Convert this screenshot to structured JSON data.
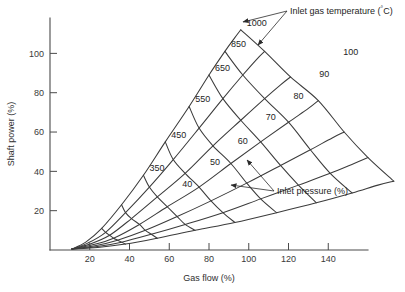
{
  "chart_data": {
    "type": "line",
    "title": "",
    "xlabel": "Gas flow (%)",
    "ylabel": "Shaft power (%)",
    "xlim": [
      0,
      160
    ],
    "ylim": [
      0,
      118
    ],
    "xticks": [
      20,
      40,
      60,
      80,
      100,
      120,
      140
    ],
    "yticks": [
      20,
      40,
      60,
      80,
      100
    ],
    "grid": false,
    "legend": "none",
    "annotations": [
      {
        "name": "inlet-gas-temperature-annotation",
        "text": "Inlet gas temperature (°C)",
        "text_x": 290,
        "text_y": 14,
        "targets": [
          [
            243,
            22
          ],
          [
            258,
            45
          ]
        ]
      },
      {
        "name": "inlet-pressure-annotation",
        "text": "Inlet pressure (%)",
        "text_x": 277,
        "text_y": 194,
        "targets": [
          [
            247,
            160
          ],
          [
            231,
            185
          ]
        ]
      }
    ],
    "series_groups": [
      {
        "group_name": "inlet-pressure",
        "group_label": "Inlet pressure (%)",
        "label_unit": "%",
        "series": [
          {
            "name": "100",
            "label": "100",
            "label_x": 144,
            "label_y": 100,
            "points": [
              [
                11,
                0.5
              ],
              [
                18,
                4
              ],
              [
                26,
                11
              ],
              [
                36,
                23
              ],
              [
                47,
                38
              ],
              [
                58,
                55
              ],
              [
                70,
                73
              ],
              [
                80,
                89
              ],
              [
                88,
                101
              ],
              [
                93,
                108
              ],
              [
                96,
                112
              ]
            ]
          },
          {
            "name": "90",
            "label": "90",
            "label_x": 132,
            "label_y": 89,
            "points": [
              [
                11,
                0.5
              ],
              [
                19,
                3.5
              ],
              [
                28,
                9
              ],
              [
                38,
                19
              ],
              [
                50,
                32
              ],
              [
                62,
                46
              ],
              [
                75,
                62
              ],
              [
                87,
                77
              ],
              [
                97,
                89
              ],
              [
                104,
                97
              ],
              [
                108,
                101
              ]
            ]
          },
          {
            "name": "80",
            "label": "80",
            "label_x": 119,
            "label_y": 78,
            "points": [
              [
                11,
                0.5
              ],
              [
                20,
                3
              ],
              [
                30,
                7.5
              ],
              [
                41,
                16
              ],
              [
                54,
                27
              ],
              [
                68,
                39
              ],
              [
                82,
                53
              ],
              [
                96,
                66
              ],
              [
                108,
                77
              ],
              [
                116,
                84
              ],
              [
                121,
                88
              ]
            ]
          },
          {
            "name": "70",
            "label": "70",
            "label_x": 105,
            "label_y": 67,
            "points": [
              [
                11,
                0.5
              ],
              [
                21,
                2.5
              ],
              [
                32,
                6
              ],
              [
                45,
                13
              ],
              [
                59,
                22
              ],
              [
                75,
                32
              ],
              [
                91,
                44
              ],
              [
                106,
                55
              ],
              [
                120,
                65
              ],
              [
                130,
                72
              ],
              [
                135,
                76
              ]
            ]
          },
          {
            "name": "60",
            "label": "60",
            "label_x": 91,
            "label_y": 55,
            "points": [
              [
                11,
                0.5
              ],
              [
                22,
                2
              ],
              [
                34,
                5
              ],
              [
                48,
                10
              ],
              [
                64,
                17
              ],
              [
                81,
                25
              ],
              [
                99,
                34
              ],
              [
                116,
                43
              ],
              [
                131,
                51
              ],
              [
                142,
                57
              ],
              [
                148,
                60
              ]
            ]
          },
          {
            "name": "50",
            "label": "50",
            "label_x": 77,
            "label_y": 44,
            "points": [
              [
                11,
                0.5
              ],
              [
                23,
                1.6
              ],
              [
                36,
                4
              ],
              [
                51,
                8
              ],
              [
                68,
                13
              ],
              [
                87,
                19
              ],
              [
                106,
                26
              ],
              [
                125,
                33
              ],
              [
                141,
                39
              ],
              [
                153,
                44
              ],
              [
                160,
                47
              ]
            ]
          },
          {
            "name": "40",
            "label": "40",
            "label_x": 63,
            "label_y": 33,
            "points": [
              [
                11,
                0.5
              ],
              [
                24,
                1.3
              ],
              [
                38,
                3
              ],
              [
                54,
                6
              ],
              [
                73,
                10
              ],
              [
                93,
                14
              ],
              [
                114,
                19
              ],
              [
                134,
                24
              ],
              [
                152,
                29
              ],
              [
                165,
                33
              ],
              [
                173,
                35
              ]
            ]
          }
        ]
      },
      {
        "group_name": "inlet-gas-temperature",
        "group_label": "Inlet gas temperature (°C)",
        "label_unit": "°C",
        "series": [
          {
            "name": "1000",
            "label": "1000",
            "label_x": 96,
            "label_y": 112,
            "points": [
              [
                96,
                112
              ],
              [
                108,
                101
              ],
              [
                121,
                88
              ],
              [
                135,
                76
              ],
              [
                148,
                60
              ],
              [
                160,
                47
              ],
              [
                173,
                35
              ]
            ]
          },
          {
            "name": "850",
            "label": "850",
            "label_x": 88,
            "label_y": 101,
            "points": [
              [
                88,
                101
              ],
              [
                97,
                89
              ],
              [
                108,
                77
              ],
              [
                120,
                65
              ],
              [
                131,
                51
              ],
              [
                141,
                39
              ],
              [
                152,
                29
              ]
            ]
          },
          {
            "name": "650",
            "label": "650",
            "label_x": 80,
            "label_y": 89,
            "points": [
              [
                80,
                89
              ],
              [
                87,
                77
              ],
              [
                96,
                66
              ],
              [
                106,
                55
              ],
              [
                116,
                43
              ],
              [
                125,
                33
              ],
              [
                134,
                24
              ]
            ]
          },
          {
            "name": "550",
            "label": "550",
            "label_x": 70,
            "label_y": 73,
            "points": [
              [
                70,
                73
              ],
              [
                75,
                62
              ],
              [
                82,
                53
              ],
              [
                91,
                44
              ],
              [
                99,
                34
              ],
              [
                106,
                26
              ],
              [
                114,
                19
              ]
            ]
          },
          {
            "name": "450",
            "label": "450",
            "label_x": 58,
            "label_y": 55,
            "points": [
              [
                58,
                55
              ],
              [
                62,
                46
              ],
              [
                68,
                39
              ],
              [
                75,
                32
              ],
              [
                81,
                25
              ],
              [
                87,
                19
              ],
              [
                93,
                14
              ]
            ]
          },
          {
            "name": "350",
            "label": "350",
            "label_x": 47,
            "label_y": 38,
            "points": [
              [
                47,
                38
              ],
              [
                50,
                32
              ],
              [
                54,
                27
              ],
              [
                59,
                22
              ],
              [
                64,
                17
              ],
              [
                68,
                13
              ],
              [
                73,
                10
              ]
            ]
          },
          {
            "name": "cross-250",
            "label": "",
            "label_x": 0,
            "label_y": 0,
            "points": [
              [
                36,
                23
              ],
              [
                38,
                19
              ],
              [
                41,
                16
              ],
              [
                45,
                13
              ],
              [
                48,
                10
              ],
              [
                51,
                8
              ],
              [
                54,
                6
              ]
            ]
          },
          {
            "name": "cross-150",
            "label": "",
            "label_x": 0,
            "label_y": 0,
            "points": [
              [
                26,
                11
              ],
              [
                28,
                9
              ],
              [
                30,
                7.5
              ],
              [
                32,
                6
              ],
              [
                34,
                5
              ],
              [
                36,
                4
              ],
              [
                38,
                3
              ]
            ]
          }
        ]
      }
    ],
    "curve_labels": {
      "pressure": [
        "100",
        "90",
        "80",
        "70",
        "60",
        "50",
        "40"
      ],
      "temperature": [
        "1000",
        "850",
        "650",
        "550",
        "450",
        "350"
      ]
    }
  },
  "axes": {
    "x_title": "Gas flow (%)",
    "y_title": "Shaft power (%)"
  }
}
